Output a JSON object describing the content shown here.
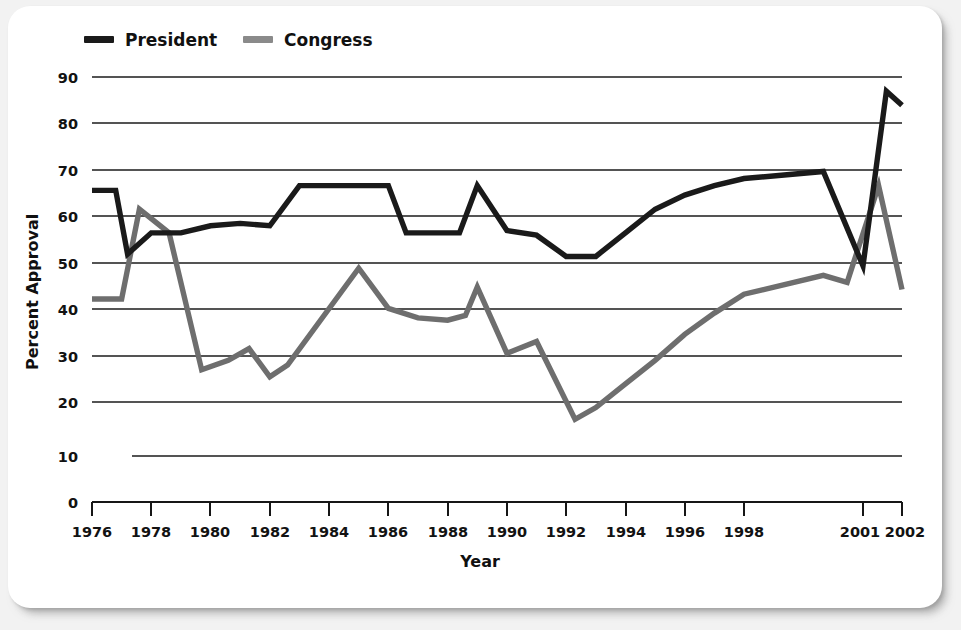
{
  "card": {
    "background": "#ffffff",
    "page_background": "#f2f2f2"
  },
  "legend": {
    "position": "top-left",
    "items": [
      {
        "label": "President",
        "color": "#1a1a1a",
        "swatch": "legend-line-dark"
      },
      {
        "label": "Congress",
        "color": "#8a8a8a",
        "swatch": "legend-line-gray"
      }
    ]
  },
  "axes": {
    "x_title": "Year",
    "y_title": "Percent Approval",
    "y_ticks": [
      "0",
      "10",
      "20",
      "30",
      "40",
      "50",
      "60",
      "70",
      "80",
      "90"
    ],
    "x_ticks": [
      "1976",
      "1978",
      "1980",
      "1982",
      "1984",
      "1986",
      "1988",
      "1990",
      "1992",
      "1994",
      "1996",
      "1998",
      "2001",
      "2002"
    ]
  },
  "chart_data": {
    "type": "line",
    "title": "",
    "xlabel": "Year",
    "ylabel": "Percent Approval",
    "xlim": [
      1976,
      2002
    ],
    "ylim": [
      0,
      90
    ],
    "grid": true,
    "legend_position": "top-left",
    "x": [
      1976,
      1977,
      1978,
      1979,
      1980,
      1981,
      1982,
      1983,
      1984,
      1985,
      1986,
      1987,
      1988,
      1989,
      1990,
      1991,
      1992,
      1993,
      1994,
      1995,
      1996,
      1997,
      1998,
      1999,
      2000,
      2001,
      2002
    ],
    "x_tick_values": [
      1976,
      1978,
      1980,
      1982,
      1984,
      1986,
      1988,
      1990,
      1992,
      1994,
      1996,
      1998,
      2001,
      2002
    ],
    "x_tick_labels": [
      "1976",
      "1978",
      "1980",
      "1982",
      "1984",
      "1986",
      "1988",
      "1990",
      "1992",
      "1994",
      "1996",
      "1998",
      "2001",
      "2002"
    ],
    "y_tick_values": [
      0,
      10,
      20,
      30,
      40,
      50,
      60,
      70,
      80,
      90
    ],
    "series": [
      {
        "name": "President",
        "color": "#1a1a1a",
        "values": [
          66,
          66,
          52.5,
          57,
          57,
          58.5,
          59,
          58.5,
          67,
          67,
          67,
          67,
          57,
          57,
          57,
          67,
          57.5,
          56.5,
          52,
          52,
          57,
          62,
          65,
          67,
          68.5,
          70,
          50,
          87,
          84
        ],
        "x_values": [
          1976,
          1976.8,
          1977.2,
          1978,
          1979,
          1980,
          1981,
          1982,
          1983,
          1984,
          1985,
          1986,
          1986.6,
          1988,
          1988.4,
          1989,
          1990,
          1991,
          1992,
          1993,
          1994,
          1995,
          1996,
          1997,
          1998,
          2000,
          2001,
          2001.6,
          2002
        ]
      },
      {
        "name": "Congress",
        "color": "#8a8a8a",
        "values": [
          43,
          43,
          62,
          57,
          28,
          30,
          32.5,
          26.5,
          29,
          49.5,
          41,
          39,
          38.5,
          39.5,
          45.5,
          31.5,
          34,
          17.5,
          20,
          25,
          30,
          35.5,
          40,
          44,
          48,
          46.5,
          67,
          45
        ],
        "x_values": [
          1976,
          1977,
          1977.6,
          1978.6,
          1979.7,
          1980.6,
          1981.3,
          1982,
          1982.6,
          1985,
          1986,
          1987,
          1988,
          1988.6,
          1989,
          1990,
          1991,
          1992.3,
          1993,
          1994,
          1995,
          1996,
          1997,
          1998,
          2000,
          2000.6,
          2001.4,
          2002
        ]
      }
    ],
    "notes": [
      "President approval starts at 66 in 1976, dips to ~52.5 in 1977, plateaus at 67 (1983-1986), dips to 52 (1992-1993), rises to 70 by 2000, falls to ~50 then spikes to ~87 in 2001 and ends at 84 in 2002.",
      "Congress approval starts at 43, peaks at 62 in 1977, falls to a low of ~17.5 in 1992, climbs steadily to ~48 by 1999, spikes to ~67 in 2001 and ends at 45 in 2002."
    ]
  }
}
